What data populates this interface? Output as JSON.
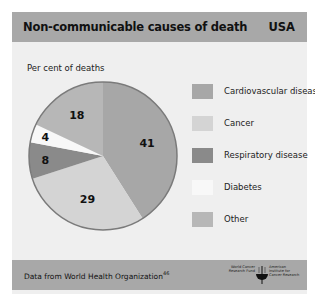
{
  "header": {
    "title": "Non-communicable causes of death",
    "country": "USA"
  },
  "chart": {
    "ylabel": "Per cent of deaths"
  },
  "legend": [
    {
      "label": "Cardiovascular disease",
      "color": "#a7a7a7"
    },
    {
      "label": "Cancer",
      "color": "#d4d4d4"
    },
    {
      "label": "Respiratory disease",
      "color": "#8a8a8a"
    },
    {
      "label": "Diabetes",
      "color": "#f8f8f8"
    },
    {
      "label": "Other",
      "color": "#b7b7b7"
    }
  ],
  "footer": {
    "source": "Data from World Health Organization",
    "source_ref": "46",
    "logo_left": "World Cancer Research Fund",
    "logo_right": "American Institute for Cancer Research"
  },
  "colors": {
    "header_bg": "#a8a8a8",
    "panel_bg": "#efefef",
    "pie_outline": "#7a7a7a"
  },
  "chart_data": {
    "type": "pie",
    "title": "Non-communicable causes of death",
    "subtitle": "USA",
    "xlabel": "",
    "ylabel": "Per cent of deaths",
    "categories": [
      "Cardiovascular disease",
      "Cancer",
      "Respiratory disease",
      "Diabetes",
      "Other"
    ],
    "values": [
      41,
      29,
      8,
      4,
      18
    ],
    "unit": "%",
    "colors": [
      "#a7a7a7",
      "#d4d4d4",
      "#8a8a8a",
      "#f8f8f8",
      "#b7b7b7"
    ],
    "start_angle": "12 o'clock",
    "direction": "clockwise",
    "legend_position": "right",
    "source": "Data from World Health Organization"
  }
}
